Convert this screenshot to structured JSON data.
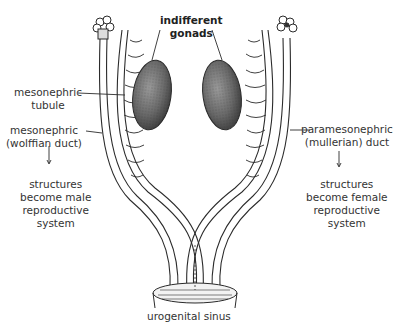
{
  "labels": {
    "gonads": [
      "indifferent",
      "gonads"
    ],
    "tubule": [
      "mesonephric",
      "tubule"
    ],
    "wolffian": [
      "mesonephric",
      "(wolffian duct)"
    ],
    "male_outcome": [
      "structures",
      "become male",
      "reproductive",
      "system"
    ],
    "mullerian": [
      "paramesonephric",
      "(mullerian) duct"
    ],
    "female_outcome": [
      "structures",
      "become female",
      "reproductive",
      "system"
    ],
    "sinus": "urogenital sinus"
  },
  "colors": {
    "line": "#2b2b2b",
    "gonad_fill": "#6f6f6f",
    "text": "#333333"
  }
}
